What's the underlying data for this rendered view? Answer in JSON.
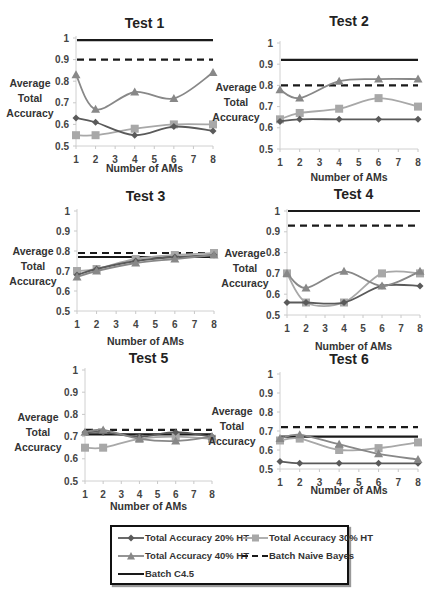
{
  "figure": {
    "y_axis_label_lines": [
      "Average",
      "Total",
      "Accuracy"
    ],
    "x_axis_label": "Number of AMs",
    "x_ticks": [
      "1",
      "2",
      "3",
      "4",
      "5",
      "6",
      "7",
      "8"
    ],
    "y_ticks": [
      "0.5",
      "0.6",
      "0.7",
      "0.8",
      "0.9",
      "1"
    ]
  },
  "colors": {
    "ht20": "#5a5a5a",
    "ht30": "#a8a8a8",
    "ht40": "#888888",
    "naive_bayes": "#1a1a1a",
    "c45": "#1a1a1a"
  },
  "legend": {
    "items": [
      {
        "key": "ht20",
        "label": "Total Accuracy 20% HT",
        "marker": "diamond",
        "style": "solid"
      },
      {
        "key": "ht30",
        "label": "Total Accuracy 30% HT",
        "marker": "square",
        "style": "solid"
      },
      {
        "key": "ht40",
        "label": "Total Accuracy 40% HT",
        "marker": "triangle",
        "style": "solid"
      },
      {
        "key": "naive_bayes",
        "label": "Batch Naive Bayes",
        "marker": "none",
        "style": "dashed"
      },
      {
        "key": "c45",
        "label": "Batch C4.5",
        "marker": "none",
        "style": "solid"
      }
    ]
  },
  "chart_data": [
    {
      "type": "line",
      "title": "Test 1",
      "xlabel": "Number of AMs",
      "ylabel": "Average Total Accuracy",
      "x": [
        1,
        2,
        4,
        6,
        8
      ],
      "xlim": [
        1,
        8
      ],
      "ylim": [
        0.5,
        1
      ],
      "grid": false,
      "legend_position": "bottom (shared)",
      "series": [
        {
          "name": "Total Accuracy 20% HT",
          "values": [
            0.63,
            0.61,
            0.55,
            0.59,
            0.57
          ]
        },
        {
          "name": "Total Accuracy 30% HT",
          "values": [
            0.55,
            0.55,
            0.58,
            0.6,
            0.6
          ]
        },
        {
          "name": "Total Accuracy 40% HT",
          "values": [
            0.83,
            0.67,
            0.75,
            0.72,
            0.84
          ]
        },
        {
          "name": "Batch Naive Bayes",
          "values": [
            0.9,
            0.9,
            0.9,
            0.9,
            0.9
          ]
        },
        {
          "name": "Batch C4.5",
          "values": [
            0.99,
            0.99,
            0.99,
            0.99,
            0.99
          ]
        }
      ]
    },
    {
      "type": "line",
      "title": "Test 2",
      "xlabel": "Number of AMs",
      "ylabel": "Average Total Accuracy",
      "x": [
        1,
        2,
        4,
        6,
        8
      ],
      "xlim": [
        1,
        8
      ],
      "ylim": [
        0.5,
        1
      ],
      "grid": false,
      "legend_position": "bottom (shared)",
      "series": [
        {
          "name": "Total Accuracy 20% HT",
          "values": [
            0.63,
            0.64,
            0.64,
            0.64,
            0.64
          ]
        },
        {
          "name": "Total Accuracy 30% HT",
          "values": [
            0.64,
            0.67,
            0.69,
            0.74,
            0.7
          ]
        },
        {
          "name": "Total Accuracy 40% HT",
          "values": [
            0.78,
            0.74,
            0.82,
            0.83,
            0.83
          ]
        },
        {
          "name": "Batch Naive Bayes",
          "values": [
            0.8,
            0.8,
            0.8,
            0.8,
            0.8
          ]
        },
        {
          "name": "Batch C4.5",
          "values": [
            0.92,
            0.92,
            0.92,
            0.92,
            0.92
          ]
        }
      ]
    },
    {
      "type": "line",
      "title": "Test 3",
      "xlabel": "Number of AMs",
      "ylabel": "Average Total Accuracy",
      "x": [
        1,
        2,
        4,
        6,
        8
      ],
      "xlim": [
        1,
        8
      ],
      "ylim": [
        0.5,
        1
      ],
      "grid": false,
      "legend_position": "bottom (shared)",
      "series": [
        {
          "name": "Total Accuracy 20% HT",
          "values": [
            0.68,
            0.71,
            0.75,
            0.77,
            0.78
          ]
        },
        {
          "name": "Total Accuracy 30% HT",
          "values": [
            0.7,
            0.71,
            0.76,
            0.78,
            0.79
          ]
        },
        {
          "name": "Total Accuracy 40% HT",
          "values": [
            0.67,
            0.7,
            0.74,
            0.76,
            0.78
          ]
        },
        {
          "name": "Batch Naive Bayes",
          "values": [
            0.79,
            0.79,
            0.79,
            0.79,
            0.79
          ]
        },
        {
          "name": "Batch C4.5",
          "values": [
            0.77,
            0.77,
            0.77,
            0.77,
            0.77
          ]
        }
      ]
    },
    {
      "type": "line",
      "title": "Test 4",
      "xlabel": "Number of AMs",
      "ylabel": "Average Total Accuracy",
      "x": [
        1,
        2,
        4,
        6,
        8
      ],
      "xlim": [
        1,
        8
      ],
      "ylim": [
        0.5,
        1
      ],
      "grid": false,
      "legend_position": "bottom (shared)",
      "series": [
        {
          "name": "Total Accuracy 20% HT",
          "values": [
            0.56,
            0.56,
            0.56,
            0.64,
            0.64
          ]
        },
        {
          "name": "Total Accuracy 30% HT",
          "values": [
            0.7,
            0.56,
            0.56,
            0.7,
            0.7
          ]
        },
        {
          "name": "Total Accuracy 40% HT",
          "values": [
            0.7,
            0.63,
            0.71,
            0.64,
            0.71
          ]
        },
        {
          "name": "Batch Naive Bayes",
          "values": [
            0.93,
            0.93,
            0.93,
            0.93,
            0.93
          ]
        },
        {
          "name": "Batch C4.5",
          "values": [
            1.0,
            1.0,
            1.0,
            1.0,
            1.0
          ]
        }
      ]
    },
    {
      "type": "line",
      "title": "Test 5",
      "xlabel": "Number of AMs",
      "ylabel": "Average Total Accuracy",
      "x": [
        1,
        2,
        4,
        6,
        8
      ],
      "xlim": [
        1,
        8
      ],
      "ylim": [
        0.5,
        1
      ],
      "grid": false,
      "legend_position": "bottom (shared)",
      "series": [
        {
          "name": "Total Accuracy 20% HT",
          "values": [
            0.72,
            0.72,
            0.7,
            0.72,
            0.7
          ]
        },
        {
          "name": "Total Accuracy 30% HT",
          "values": [
            0.65,
            0.65,
            0.69,
            0.7,
            0.69
          ]
        },
        {
          "name": "Total Accuracy 40% HT",
          "values": [
            0.72,
            0.73,
            0.69,
            0.68,
            0.7
          ]
        },
        {
          "name": "Batch Naive Bayes",
          "values": [
            0.73,
            0.73,
            0.73,
            0.73,
            0.73
          ]
        },
        {
          "name": "Batch C4.5",
          "values": [
            0.71,
            0.71,
            0.71,
            0.71,
            0.71
          ]
        }
      ]
    },
    {
      "type": "line",
      "title": "Test 6",
      "xlabel": "Number of AMs",
      "ylabel": "Average Total Accuracy",
      "x": [
        1,
        2,
        4,
        6,
        8
      ],
      "xlim": [
        1,
        8
      ],
      "ylim": [
        0.5,
        1
      ],
      "grid": false,
      "legend_position": "bottom (shared)",
      "series": [
        {
          "name": "Total Accuracy 20% HT",
          "values": [
            0.54,
            0.53,
            0.53,
            0.53,
            0.53
          ]
        },
        {
          "name": "Total Accuracy 30% HT",
          "values": [
            0.65,
            0.66,
            0.6,
            0.61,
            0.64
          ]
        },
        {
          "name": "Total Accuracy 40% HT",
          "values": [
            0.66,
            0.68,
            0.63,
            0.58,
            0.55
          ]
        },
        {
          "name": "Batch Naive Bayes",
          "values": [
            0.72,
            0.72,
            0.72,
            0.72,
            0.72
          ]
        },
        {
          "name": "Batch C4.5",
          "values": [
            0.67,
            0.67,
            0.67,
            0.67,
            0.67
          ]
        }
      ]
    }
  ]
}
